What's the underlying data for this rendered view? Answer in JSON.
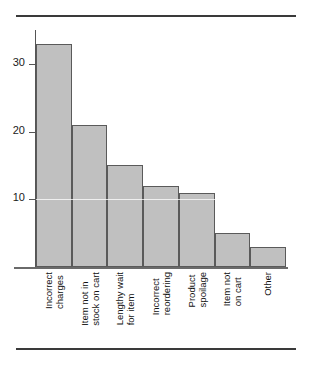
{
  "chart_data": {
    "type": "bar",
    "title": "",
    "subtitle": "",
    "xlabel": "",
    "ylabel": "",
    "categories": [
      "Incorrect charges",
      "Item not in stock on cart",
      "Lengthy wait for item",
      "Incorrect reordering",
      "Product spoilage",
      "Item not on cart",
      "Other"
    ],
    "category_lines": [
      [
        "Incorrect",
        "charges"
      ],
      [
        "Item not in",
        "stock on cart"
      ],
      [
        "Lengthy wait",
        "for item"
      ],
      [
        "Incorrect",
        "reordering"
      ],
      [
        "Product",
        "spoilage"
      ],
      [
        "Item not",
        "on cart"
      ],
      [
        "Other",
        ""
      ]
    ],
    "values": [
      33,
      21,
      15,
      12,
      11,
      5,
      3
    ],
    "ylim": [
      0,
      35
    ],
    "yticks": [
      10,
      20,
      30
    ],
    "ytick_labels": [
      "10",
      "20",
      "30"
    ],
    "grid": false,
    "legend": false,
    "bar_fill_color": "#c0c0c0",
    "bar_edge_color": "#5a5a5a",
    "axis_color": "#555555",
    "rule_color": "#3a3a3a",
    "text_color": "#111111"
  }
}
